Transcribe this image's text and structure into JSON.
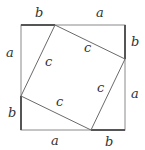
{
  "diagram": {
    "outer_square": {
      "x": 21,
      "y": 25,
      "size": 104
    },
    "segment_a": 70,
    "segment_b": 34,
    "inner_vertices": [
      [
        55,
        25
      ],
      [
        125,
        59
      ],
      [
        91,
        130
      ],
      [
        21,
        96
      ]
    ],
    "colors": {
      "line": "#8a8a8a",
      "thick": "#555555",
      "text": "#333333"
    },
    "labels": {
      "top_b": "b",
      "top_a": "a",
      "right_b": "b",
      "right_a": "a",
      "bottom_a": "a",
      "bottom_b": "b",
      "left_a": "a",
      "left_b": "b",
      "c_top": "c",
      "c_right": "c",
      "c_bottom": "c",
      "c_left": "c"
    }
  }
}
